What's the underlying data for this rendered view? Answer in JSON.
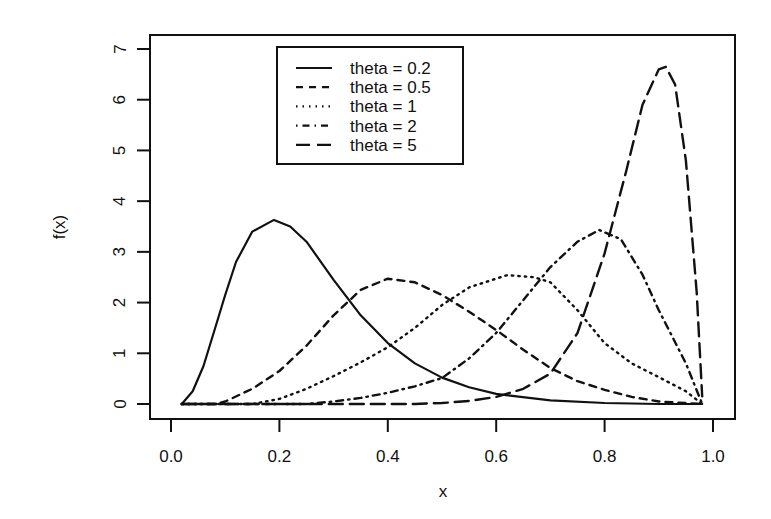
{
  "chart_data": {
    "type": "line",
    "title": "",
    "xlabel": "x",
    "ylabel": "f(x)",
    "xlim": [
      0.0,
      1.0
    ],
    "ylim": [
      0,
      7
    ],
    "grid": false,
    "legend_position": "top-left-center (inside plot)",
    "x_ticks": [
      "0.0",
      "0.2",
      "0.4",
      "0.6",
      "0.8",
      "1.0"
    ],
    "y_ticks": [
      "0",
      "1",
      "2",
      "3",
      "4",
      "5",
      "6",
      "7"
    ],
    "series": [
      {
        "name": "theta = 0.2",
        "line_style": "solid",
        "x": [
          0.02,
          0.04,
          0.06,
          0.08,
          0.1,
          0.12,
          0.15,
          0.19,
          0.22,
          0.25,
          0.3,
          0.35,
          0.4,
          0.45,
          0.5,
          0.55,
          0.6,
          0.7,
          0.8,
          0.9,
          0.98
        ],
        "y": [
          0.0,
          0.25,
          0.75,
          1.45,
          2.15,
          2.8,
          3.4,
          3.63,
          3.5,
          3.2,
          2.45,
          1.75,
          1.2,
          0.8,
          0.52,
          0.33,
          0.2,
          0.07,
          0.02,
          0.0,
          0.0
        ]
      },
      {
        "name": "theta = 0.5",
        "line_style": "dashed",
        "x": [
          0.02,
          0.08,
          0.1,
          0.15,
          0.2,
          0.25,
          0.3,
          0.35,
          0.4,
          0.45,
          0.5,
          0.55,
          0.6,
          0.65,
          0.7,
          0.75,
          0.8,
          0.85,
          0.9,
          0.98
        ],
        "y": [
          0.0,
          0.0,
          0.05,
          0.3,
          0.65,
          1.15,
          1.75,
          2.25,
          2.47,
          2.4,
          2.15,
          1.82,
          1.46,
          1.07,
          0.71,
          0.45,
          0.28,
          0.14,
          0.05,
          0.0
        ]
      },
      {
        "name": "theta = 1",
        "line_style": "dotted",
        "x": [
          0.02,
          0.15,
          0.2,
          0.25,
          0.3,
          0.35,
          0.4,
          0.45,
          0.5,
          0.55,
          0.62,
          0.67,
          0.7,
          0.75,
          0.8,
          0.85,
          0.9,
          0.95,
          0.98
        ],
        "y": [
          0.0,
          0.0,
          0.1,
          0.3,
          0.55,
          0.82,
          1.12,
          1.5,
          1.95,
          2.3,
          2.54,
          2.5,
          2.4,
          1.85,
          1.2,
          0.8,
          0.53,
          0.25,
          0.0
        ]
      },
      {
        "name": "theta = 2",
        "line_style": "dashdot",
        "x": [
          0.02,
          0.25,
          0.3,
          0.35,
          0.4,
          0.45,
          0.5,
          0.55,
          0.6,
          0.65,
          0.7,
          0.75,
          0.79,
          0.83,
          0.87,
          0.9,
          0.95,
          0.98
        ],
        "y": [
          0.0,
          0.0,
          0.05,
          0.12,
          0.22,
          0.35,
          0.51,
          0.9,
          1.4,
          2.05,
          2.7,
          3.2,
          3.43,
          3.25,
          2.55,
          1.85,
          0.8,
          0.0
        ]
      },
      {
        "name": "theta = 5",
        "line_style": "longdash",
        "x": [
          0.02,
          0.45,
          0.5,
          0.55,
          0.6,
          0.65,
          0.7,
          0.75,
          0.8,
          0.84,
          0.87,
          0.9,
          0.913,
          0.93,
          0.95,
          0.97,
          0.98
        ],
        "y": [
          0.0,
          0.0,
          0.02,
          0.06,
          0.14,
          0.3,
          0.6,
          1.4,
          2.97,
          4.6,
          5.9,
          6.6,
          6.65,
          6.3,
          4.8,
          2.2,
          0.15
        ]
      }
    ]
  },
  "legend": {
    "items": [
      {
        "label": "theta = 0.2",
        "style": "solid"
      },
      {
        "label": "theta = 0.5",
        "style": "dashed"
      },
      {
        "label": "theta = 1",
        "style": "dotted"
      },
      {
        "label": "theta = 2",
        "style": "dashdot"
      },
      {
        "label": "theta = 5",
        "style": "longdash"
      }
    ]
  },
  "colors": {
    "ink": "#111111",
    "background": "#ffffff"
  }
}
